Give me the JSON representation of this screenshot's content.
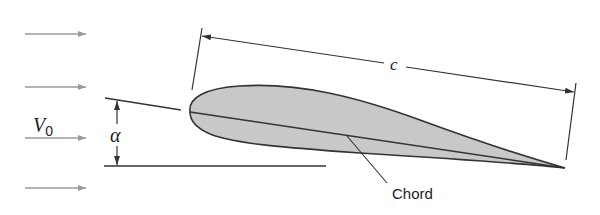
{
  "figure": {
    "labels": {
      "velocity": "V",
      "velocity_subscript": "0",
      "angle": "α",
      "chord_length": "c",
      "chord": "Chord"
    },
    "colors": {
      "airfoil_fill": "#c8c8c8",
      "outline": "#333333",
      "flow_arrows": "#9a9a9a"
    },
    "flow_arrows_count": 4
  }
}
